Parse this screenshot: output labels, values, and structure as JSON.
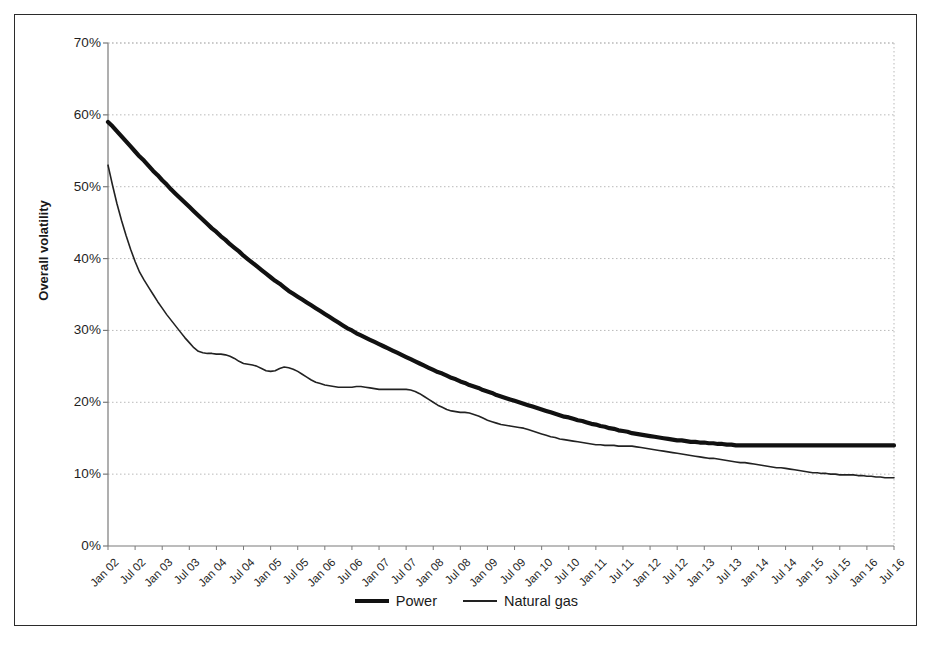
{
  "chart_data": {
    "type": "line",
    "title": "",
    "xlabel": "",
    "ylabel": "Overall volatility",
    "ylim": [
      0,
      70
    ],
    "yticks": [
      0,
      10,
      20,
      30,
      40,
      50,
      60,
      70
    ],
    "ytick_labels": [
      "0%",
      "10%",
      "20%",
      "30%",
      "40%",
      "50%",
      "60%",
      "70%"
    ],
    "grid": true,
    "grid_style": "dotted",
    "legend_position": "bottom-center",
    "x_tick_labels": [
      "Jan 02",
      "Jul 02",
      "Jan 03",
      "Jul 03",
      "Jan 04",
      "Jul 04",
      "Jan 05",
      "Jul 05",
      "Jan 06",
      "Jul 06",
      "Jan 07",
      "Jul 07",
      "Jan 08",
      "Jul 08",
      "Jan 09",
      "Jul 09",
      "Jan 10",
      "Jul 10",
      "Jan 11",
      "Jul 11",
      "Jan 12",
      "Jul 12",
      "Jan 13",
      "Jul 13",
      "Jan 14",
      "Jul 14",
      "Jan 15",
      "Jul 15",
      "Jan 16",
      "Jul 16"
    ],
    "x_start": "Jan 02",
    "x_end": "Jul 16",
    "series": [
      {
        "name": "Power",
        "color": "#111111",
        "line_width": 4.2,
        "values": [
          59.0,
          58.4,
          57.7,
          57.0,
          56.3,
          55.6,
          54.9,
          54.2,
          53.6,
          52.9,
          52.2,
          51.6,
          50.9,
          50.3,
          49.6,
          49.0,
          48.4,
          47.8,
          47.2,
          46.6,
          46.0,
          45.4,
          44.8,
          44.2,
          43.7,
          43.1,
          42.6,
          42.0,
          41.5,
          41.0,
          40.4,
          39.9,
          39.4,
          38.9,
          38.4,
          37.9,
          37.4,
          36.9,
          36.5,
          36.0,
          35.5,
          35.1,
          34.7,
          34.3,
          33.9,
          33.5,
          33.1,
          32.7,
          32.3,
          31.9,
          31.5,
          31.1,
          30.7,
          30.3,
          30.0,
          29.6,
          29.3,
          29.0,
          28.7,
          28.4,
          28.1,
          27.8,
          27.5,
          27.2,
          26.9,
          26.6,
          26.3,
          26.0,
          25.7,
          25.4,
          25.1,
          24.8,
          24.5,
          24.2,
          24.0,
          23.7,
          23.4,
          23.2,
          22.9,
          22.7,
          22.4,
          22.2,
          22.0,
          21.7,
          21.5,
          21.3,
          21.0,
          20.8,
          20.6,
          20.4,
          20.2,
          20.0,
          19.8,
          19.6,
          19.4,
          19.2,
          19.0,
          18.8,
          18.6,
          18.4,
          18.2,
          18.0,
          17.9,
          17.7,
          17.5,
          17.4,
          17.2,
          17.0,
          16.9,
          16.7,
          16.6,
          16.4,
          16.3,
          16.1,
          16.0,
          15.9,
          15.7,
          15.6,
          15.5,
          15.4,
          15.3,
          15.2,
          15.1,
          15.0,
          14.9,
          14.8,
          14.7,
          14.7,
          14.6,
          14.5,
          14.5,
          14.4,
          14.4,
          14.3,
          14.3,
          14.2,
          14.2,
          14.1,
          14.1,
          14.0,
          14.0,
          14.0,
          14.0,
          14.0,
          14.0,
          14.0,
          14.0,
          14.0,
          14.0,
          14.0,
          14.0,
          14.0,
          14.0,
          14.0,
          14.0,
          14.0,
          14.0,
          14.0,
          14.0,
          14.0,
          14.0,
          14.0,
          14.0,
          14.0,
          14.0,
          14.0,
          14.0,
          14.0,
          14.0,
          14.0,
          14.0,
          14.0,
          14.0,
          14.0,
          14.0
        ]
      },
      {
        "name": "Natural gas",
        "color": "#222222",
        "line_width": 1.6,
        "values": [
          53.0,
          50.2,
          47.6,
          45.3,
          43.2,
          41.3,
          39.6,
          38.1,
          37.0,
          36.0,
          35.0,
          34.0,
          33.1,
          32.2,
          31.4,
          30.6,
          29.8,
          29.0,
          28.3,
          27.6,
          27.1,
          26.9,
          26.8,
          26.8,
          26.7,
          26.7,
          26.6,
          26.4,
          26.1,
          25.7,
          25.4,
          25.3,
          25.2,
          25.0,
          24.7,
          24.4,
          24.3,
          24.4,
          24.7,
          24.9,
          24.8,
          24.6,
          24.3,
          23.9,
          23.5,
          23.1,
          22.8,
          22.6,
          22.4,
          22.3,
          22.2,
          22.1,
          22.1,
          22.1,
          22.1,
          22.2,
          22.2,
          22.1,
          22.0,
          21.9,
          21.8,
          21.8,
          21.8,
          21.8,
          21.8,
          21.8,
          21.8,
          21.7,
          21.5,
          21.2,
          20.8,
          20.4,
          20.0,
          19.6,
          19.3,
          19.0,
          18.8,
          18.7,
          18.6,
          18.6,
          18.5,
          18.3,
          18.1,
          17.8,
          17.5,
          17.3,
          17.1,
          16.9,
          16.8,
          16.7,
          16.6,
          16.5,
          16.4,
          16.2,
          16.0,
          15.8,
          15.6,
          15.4,
          15.2,
          15.1,
          14.9,
          14.8,
          14.7,
          14.6,
          14.5,
          14.4,
          14.3,
          14.2,
          14.1,
          14.1,
          14.0,
          14.0,
          14.0,
          13.9,
          13.9,
          13.9,
          13.9,
          13.8,
          13.7,
          13.6,
          13.5,
          13.4,
          13.3,
          13.2,
          13.1,
          13.0,
          12.9,
          12.8,
          12.7,
          12.6,
          12.5,
          12.4,
          12.3,
          12.2,
          12.2,
          12.1,
          12.0,
          11.9,
          11.8,
          11.7,
          11.6,
          11.6,
          11.5,
          11.4,
          11.3,
          11.2,
          11.1,
          11.0,
          10.9,
          10.9,
          10.8,
          10.7,
          10.6,
          10.5,
          10.4,
          10.3,
          10.2,
          10.2,
          10.1,
          10.1,
          10.0,
          10.0,
          9.9,
          9.9,
          9.9,
          9.9,
          9.8,
          9.8,
          9.7,
          9.7,
          9.6,
          9.6,
          9.5,
          9.5,
          9.5
        ]
      }
    ]
  },
  "legend": {
    "entries": [
      {
        "label": "Power",
        "style": "thick"
      },
      {
        "label": "Natural gas",
        "style": "thin"
      }
    ]
  },
  "axes": {
    "y_title": "Overall volatility"
  },
  "colors": {
    "power": "#111111",
    "natural_gas": "#222222",
    "grid": "#b9b9b9",
    "axis": "#7a7a7a",
    "frame": "#2b2b2b"
  }
}
